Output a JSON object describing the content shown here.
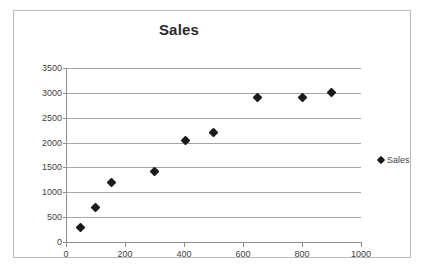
{
  "chart_data": {
    "type": "scatter",
    "title": "Sales",
    "xlabel": "",
    "ylabel": "",
    "xlim": [
      0,
      1000
    ],
    "ylim": [
      0,
      3500
    ],
    "xticks": [
      0,
      200,
      400,
      600,
      800,
      1000
    ],
    "yticks": [
      0,
      500,
      1000,
      1500,
      2000,
      2500,
      3000,
      3500
    ],
    "xtick_labels": [
      "0",
      "200",
      "400",
      "600",
      "800",
      "1000"
    ],
    "ytick_labels": [
      "0",
      "500",
      "1000",
      "1500",
      "2000",
      "2500",
      "3000",
      "3500"
    ],
    "grid": "horizontal",
    "legend_position": "right",
    "marker": "diamond",
    "marker_color": "#1a1a1a",
    "series": [
      {
        "name": "Sales",
        "points": [
          {
            "x": 50,
            "y": 290
          },
          {
            "x": 100,
            "y": 700
          },
          {
            "x": 155,
            "y": 1200
          },
          {
            "x": 300,
            "y": 1410
          },
          {
            "x": 405,
            "y": 2050
          },
          {
            "x": 500,
            "y": 2200
          },
          {
            "x": 650,
            "y": 2900
          },
          {
            "x": 800,
            "y": 2900
          },
          {
            "x": 900,
            "y": 3000
          }
        ]
      }
    ]
  },
  "legend": {
    "entries": [
      {
        "label": "Sales"
      }
    ]
  }
}
